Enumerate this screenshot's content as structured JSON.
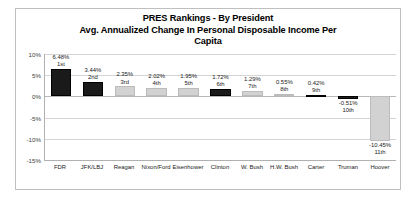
{
  "chart_data": {
    "type": "bar",
    "title": "PRES Rankings - By President",
    "title_lines": [
      "PRES Rankings - By President",
      "Avg. Annualized Change In Personal Disposable Income Per",
      "Capita"
    ],
    "subtitle": "Avg. Annualized Change In Personal Disposable Income Per Capita",
    "xlabel": "",
    "ylabel": "",
    "ylim": [
      -15,
      10
    ],
    "ytick_labels": [
      "10%",
      "5%",
      "0%",
      "-5%",
      "-10%",
      "-15%"
    ],
    "ytick_values": [
      10,
      5,
      0,
      -5,
      -10,
      -15
    ],
    "grid": true,
    "legend": "none",
    "categories": [
      "FDR",
      "JFK/LBJ",
      "Reagan",
      "Nixon/Ford",
      "Eisenhower",
      "Clinton",
      "W. Bush",
      "H.W. Bush",
      "Carter",
      "Truman",
      "Hoover"
    ],
    "values": [
      6.48,
      3.44,
      2.35,
      2.02,
      1.95,
      1.72,
      1.29,
      0.55,
      0.42,
      -0.51,
      -10.45
    ],
    "value_labels": [
      "6.48%",
      "3.44%",
      "2.35%",
      "2.02%",
      "1.95%",
      "1.72%",
      "1.29%",
      "0.55%",
      "0.42%",
      "-0.51%",
      "-10.45%"
    ],
    "rank_labels": [
      "1st",
      "2nd",
      "3rd",
      "4th",
      "5th",
      "6th",
      "7th",
      "8th",
      "9th",
      "10th",
      "11th"
    ],
    "bar_styles": [
      "dark",
      "dark",
      "light",
      "light",
      "light",
      "dark",
      "light",
      "light",
      "dark",
      "dark",
      "light"
    ],
    "colors": {
      "dark_bar": "#1a1a1a",
      "light_bar": "#d2d2d2",
      "gridline": "#d4d4d4",
      "axis": "#b0b0b0",
      "text": "#1a1a1a",
      "border": "#bfbfbf",
      "background": "#ffffff"
    }
  }
}
